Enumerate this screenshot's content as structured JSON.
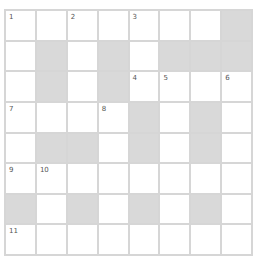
{
  "puzzle": {
    "rows": 8,
    "cols": 8,
    "layout": [
      "WWWWWWWB",
      "WBWBWBBB",
      "WBWBWWWW",
      "WWWWBWBW",
      "WBBWBWBW",
      "WWWWWWWW",
      "BWBWBWBW",
      "WWWWWWWW"
    ],
    "numbers": [
      {
        "row": 0,
        "col": 0,
        "n": "1"
      },
      {
        "row": 0,
        "col": 2,
        "n": "2"
      },
      {
        "row": 0,
        "col": 4,
        "n": "3"
      },
      {
        "row": 2,
        "col": 4,
        "n": "4"
      },
      {
        "row": 2,
        "col": 5,
        "n": "5"
      },
      {
        "row": 2,
        "col": 7,
        "n": "6"
      },
      {
        "row": 3,
        "col": 0,
        "n": "7"
      },
      {
        "row": 3,
        "col": 3,
        "n": "8"
      },
      {
        "row": 5,
        "col": 0,
        "n": "9"
      },
      {
        "row": 5,
        "col": 1,
        "n": "10"
      },
      {
        "row": 7,
        "col": 0,
        "n": "11"
      }
    ],
    "colors": {
      "grid_line": "#d6d6d6",
      "block": "#d9d9d9",
      "cell": "#ffffff"
    }
  }
}
